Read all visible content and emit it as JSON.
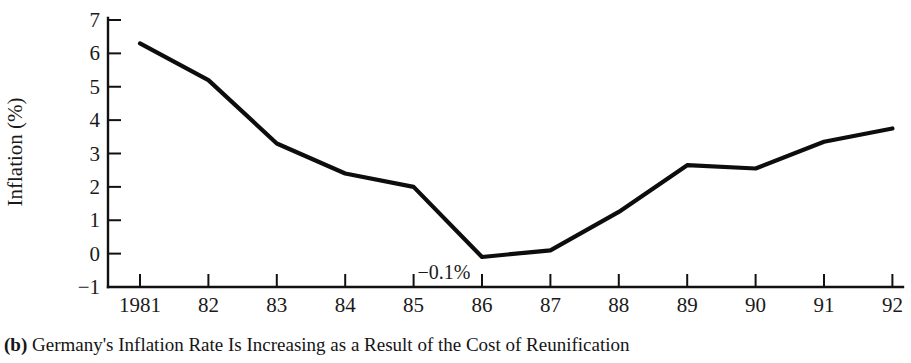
{
  "figure": {
    "caption_tag": "(b)",
    "caption_text": "Germany's Inflation Rate Is Increasing as a Result of the Cost of Reunification"
  },
  "chart_data": {
    "type": "line",
    "title": "",
    "xlabel": "",
    "ylabel": "Inflation (%)",
    "categories": [
      "1981",
      "82",
      "83",
      "84",
      "85",
      "86",
      "87",
      "88",
      "89",
      "90",
      "91",
      "92"
    ],
    "x_tick_labels": [
      "1981",
      "82",
      "83",
      "84",
      "85",
      "86",
      "87",
      "88",
      "89",
      "90",
      "91",
      "92"
    ],
    "y_tick_labels": [
      "7",
      "6",
      "5",
      "4",
      "3",
      "2",
      "1",
      "0",
      "−1"
    ],
    "values": [
      6.3,
      5.2,
      3.3,
      2.4,
      2.0,
      -0.1,
      0.1,
      1.25,
      2.65,
      2.55,
      3.35,
      3.75
    ],
    "ylim": [
      -1,
      7
    ],
    "y_tick_step": 1,
    "grid": false,
    "legend": "none",
    "line_color": "#0d0d0d",
    "annotations": [
      {
        "label": "−0.1%",
        "x_category": "86",
        "value": -0.1
      }
    ]
  }
}
